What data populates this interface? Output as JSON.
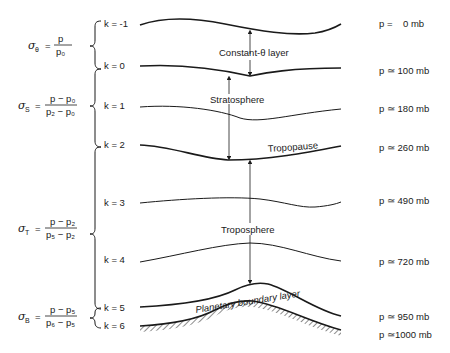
{
  "diagram": {
    "title": "",
    "sigma_definitions": [
      {
        "symbol": "σ",
        "subscript": "θ",
        "equals": "=",
        "numerator": "p",
        "denominator": "p₀"
      },
      {
        "symbol": "σ",
        "subscript": "S",
        "equals": "=",
        "numerator": "p − p₀",
        "denominator": "p₂ − p₀"
      },
      {
        "symbol": "σ",
        "subscript": "T",
        "equals": "=",
        "numerator": "p − p₂",
        "denominator": "p₅ − p₂"
      },
      {
        "symbol": "σ",
        "subscript": "B",
        "equals": "=",
        "numerator": "p − p₅",
        "denominator": "p₆ − p₅"
      }
    ],
    "levels": [
      {
        "k": "k = -1",
        "pressure": "p =    0 mb"
      },
      {
        "k": "k = 0",
        "pressure": "p ≃ 100 mb"
      },
      {
        "k": "k = 1",
        "pressure": "p ≃ 180 mb"
      },
      {
        "k": "k = 2",
        "pressure": "p ≃ 260 mb"
      },
      {
        "k": "k = 3",
        "pressure": "p ≃ 490 mb"
      },
      {
        "k": "k = 4",
        "pressure": "p ≃ 720 mb"
      },
      {
        "k": "k = 5",
        "pressure": "p ≃ 950 mb"
      },
      {
        "k": "k = 6",
        "pressure": "p ≃1000 mb"
      }
    ],
    "layer_labels": {
      "constant_theta": "Constant-θ  layer",
      "stratosphere": "Stratosphere",
      "tropopause": "Tropopause",
      "troposphere": "Troposphere",
      "pbl": "Planetary boundary layer"
    },
    "colors": {
      "ink": "#1a1a1a",
      "background": "#ffffff"
    }
  }
}
